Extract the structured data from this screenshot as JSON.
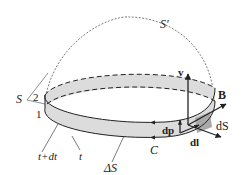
{
  "figure": {
    "colors": {
      "band_fill": "#dcdcdc",
      "band_dark": "#a9a9a9",
      "stroke": "#222222",
      "dashed": "#444444",
      "background": "#ffffff"
    },
    "labels": {
      "surface_prime": "S′",
      "surface": "S",
      "side_1": "1",
      "side_2": "2",
      "time_later": "t+dt",
      "time": "t",
      "delta_S": "ΔS",
      "curve": "C",
      "velocity": "v",
      "field": "B",
      "dS": "dS",
      "dl": "dl",
      "dp": "dp"
    }
  }
}
